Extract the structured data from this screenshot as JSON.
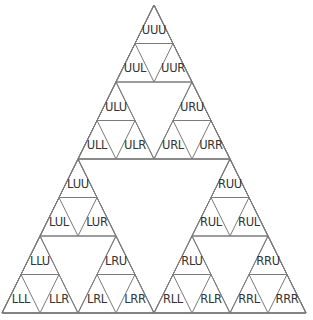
{
  "diagram": {
    "type": "sierpinski-triangle",
    "levels": 3,
    "geometry": {
      "apex": [
        154,
        5
      ],
      "left": [
        2,
        313
      ],
      "right": [
        306,
        313
      ]
    },
    "colors": {
      "stroke": "#7a7a7a",
      "text": "#333333",
      "background": "#ffffff"
    },
    "labels": {
      "UUU": "UUU",
      "UUL": "UUL",
      "UUR": "UUR",
      "ULU": "ULU",
      "ULL": "ULL",
      "ULR": "ULR",
      "URU": "URU",
      "URL": "URL",
      "URR": "URR",
      "LUU": "LUU",
      "LUL": "LUL",
      "LUR": "LUR",
      "LLU": "LLU",
      "LLL": "LLL",
      "LLR": "LLR",
      "LRU": "LRU",
      "LRL": "LRL",
      "LRR": "LRR",
      "RUU": "RUU",
      "RUL": "RUL",
      "RUR": "RUL",
      "RLU": "RLU",
      "RLL": "RLL",
      "RLR": "RLR",
      "RRU": "RRU",
      "RRL": "RRL",
      "RRR": "RRR"
    }
  }
}
